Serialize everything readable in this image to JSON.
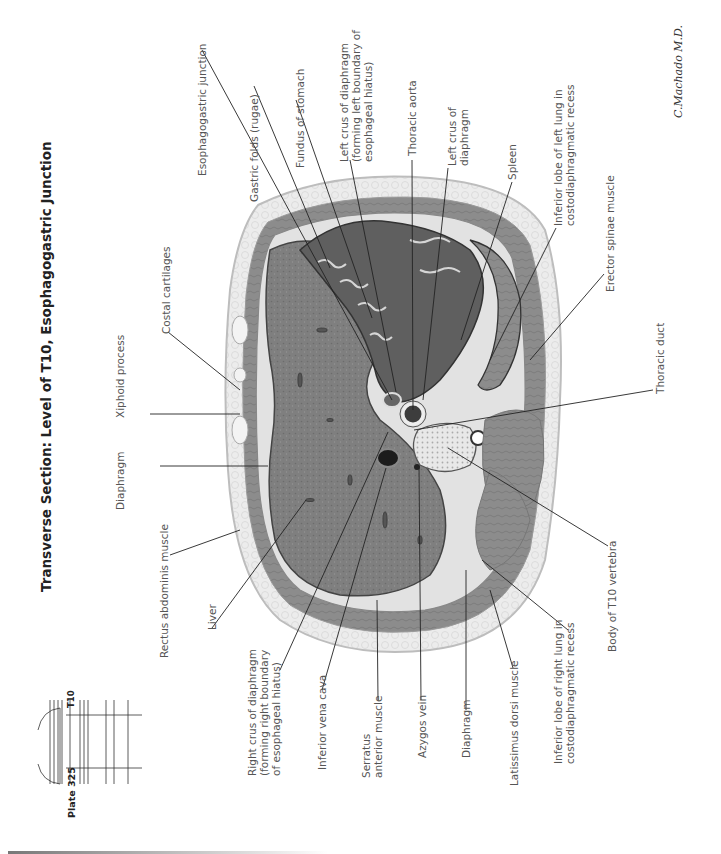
{
  "figure": {
    "title": "Transverse Section: Level of T10, Esophagogastric Junction",
    "plate_label": "Plate 325",
    "level_marker": "T10",
    "signature": "C.Machado M.D.",
    "orientation": "rotated 90° counter-clockwise (text reads bottom-to-top)"
  },
  "labels": {
    "esophagogastric_junction": "Esophagogastric junction",
    "gastric_folds": "Gastric folds (rugae)",
    "fundus_of_stomach": "Fundus of stomach",
    "left_crus_hiatus": {
      "line1": "Left crus of diaphragm",
      "line2": "(forming left boundary of",
      "line3": "esophageal hiatus)"
    },
    "thoracic_aorta": "Thoracic aorta",
    "left_crus": {
      "line1": "Left crus of",
      "line2": "diaphragm"
    },
    "spleen": "Spleen",
    "inferior_lobe_left_lung": {
      "line1": "Inferior lobe of left lung in",
      "line2": "costodiaphragmatic recess"
    },
    "erector_spinae": "Erector spinae muscle",
    "thoracic_duct": "Thoracic duct",
    "body_t10_vertebra": "Body of T10 vertebra",
    "inferior_lobe_right_lung": {
      "line1": "Inferior lobe of right lung in",
      "line2": "costodiaphragmatic recess"
    },
    "latissimus_dorsi": "Latissimus dorsi muscle",
    "diaphragm_lower": "Diaphragm",
    "azygos_vein": "Azygos vein",
    "serratus_anterior": {
      "line1": "Serratus",
      "line2": "anterior muscle"
    },
    "inferior_vena_cava": "Inferior vena cava",
    "right_crus_hiatus": {
      "line1": "Right crus of diaphragm",
      "line2": "(forming right boundary",
      "line3": "of esophageal hiatus)"
    },
    "liver": "Liver",
    "rectus_abdominis": "Rectus abdominis muscle",
    "diaphragm_upper": "Diaphragm",
    "xiphoid_process": "Xiphoid process",
    "costal_cartilages": "Costal cartilages"
  },
  "colors": {
    "background": "#ffffff",
    "liver": "#7d7d7d",
    "stomach_lumen": "#5e5e5e",
    "muscle": "#8a8a8a",
    "fat": "#e6e6e6",
    "skin": "#d4d4d4",
    "leader_line": "#222222",
    "label_text": "#555555"
  }
}
